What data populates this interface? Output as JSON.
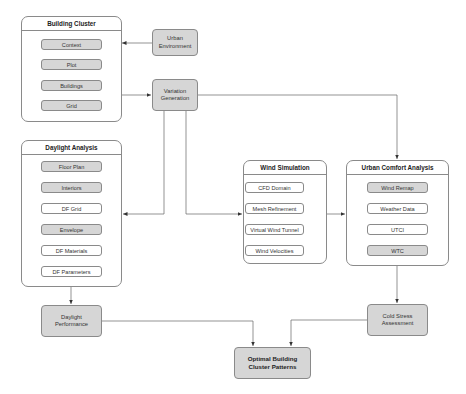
{
  "panels": {
    "building_cluster": {
      "title": "Building Cluster",
      "items": [
        "Context",
        "Plot",
        "Buildings",
        "Grid"
      ]
    },
    "daylight_analysis": {
      "title": "Daylight Analysis",
      "items": [
        "Floor Plan",
        "Interiors",
        "DF Grid",
        "Envelope",
        "DF Materials",
        "DF Parameters"
      ]
    },
    "wind_simulation": {
      "title": "Wind Simulation",
      "items": [
        "CFD Domain",
        "Mesh Refinement",
        "Virtual Wind Tunnel",
        "Wind Velocities"
      ]
    },
    "urban_comfort_analysis": {
      "title": "Urban Comfort Analysis",
      "items": [
        "Wind Remap",
        "Weather Data",
        "UTCI",
        "WTC"
      ]
    }
  },
  "blocks": {
    "urban_environment": "Urban\nEnvironment",
    "variation_generation": "Variation\nGeneration",
    "daylight_performance": "Daylight\nPerformance",
    "cold_stress_assessment": "Cold Stress\nAssessment",
    "optimal_patterns": "Optimal Building\nCluster Patterns"
  },
  "colors": {
    "gray_fill": "#d6d6d6",
    "stroke": "#8a8a8a",
    "arrow": "#333333"
  }
}
